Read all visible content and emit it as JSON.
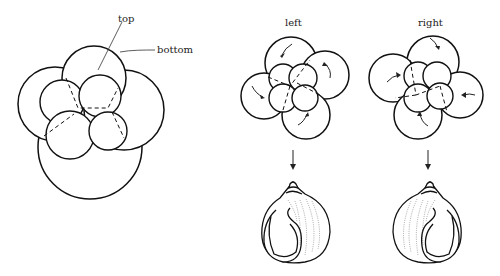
{
  "labels": {
    "top": "top",
    "bottom": "bottom",
    "left": "left",
    "right": "right"
  },
  "panels": [
    {
      "id": "foraminifera-test",
      "annotations": [
        "top",
        "bottom"
      ]
    },
    {
      "id": "left-coiling",
      "title": "left",
      "chamber_arrows": "counterclockwise",
      "shell": "sinistral"
    },
    {
      "id": "right-coiling",
      "title": "right",
      "chamber_arrows": "clockwise",
      "shell": "dextral"
    }
  ]
}
